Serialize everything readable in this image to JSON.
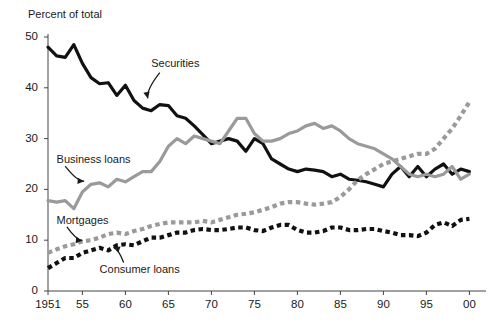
{
  "chart_data": {
    "type": "line",
    "title": "",
    "subtitle": "",
    "ylabel": "Percent of total",
    "xlabel": "",
    "ylim": [
      0,
      50
    ],
    "xlim": [
      1951,
      2001
    ],
    "grid": false,
    "legend_position": "inline-annotations",
    "ytick_labels": [
      "0",
      "10",
      "20",
      "30",
      "40",
      "50"
    ],
    "ytick_values": [
      0,
      10,
      20,
      30,
      40,
      50
    ],
    "xtick_labels": [
      "1951",
      "55",
      "60",
      "65",
      "70",
      "75",
      "80",
      "85",
      "90",
      "95",
      "00"
    ],
    "xtick_values": [
      1951,
      1955,
      1960,
      1965,
      1970,
      1975,
      1980,
      1985,
      1990,
      1995,
      2000
    ],
    "annotations": [
      {
        "text": "Securities",
        "x": 1963,
        "y": 44.5
      },
      {
        "text": "Business loans",
        "x": 1952,
        "y": 25.5
      },
      {
        "text": "Mortgages",
        "x": 1952,
        "y": 13.5
      },
      {
        "text": "Consumer loans",
        "x": 1957,
        "y": 4.0
      }
    ],
    "x": [
      1951,
      1952,
      1953,
      1954,
      1955,
      1956,
      1957,
      1958,
      1959,
      1960,
      1961,
      1962,
      1963,
      1964,
      1965,
      1966,
      1967,
      1968,
      1969,
      1970,
      1971,
      1972,
      1973,
      1974,
      1975,
      1976,
      1977,
      1978,
      1979,
      1980,
      1981,
      1982,
      1983,
      1984,
      1985,
      1986,
      1987,
      1988,
      1989,
      1990,
      1991,
      1992,
      1993,
      1994,
      1995,
      1996,
      1997,
      1998,
      1999,
      2000
    ],
    "series": [
      {
        "name": "Securities",
        "color": "#111111",
        "style": "solid",
        "values": [
          48.0,
          46.3,
          46.0,
          48.5,
          44.8,
          42.0,
          40.8,
          41.0,
          38.5,
          40.5,
          37.5,
          36.0,
          35.5,
          36.7,
          36.5,
          34.5,
          34.0,
          32.5,
          30.8,
          29.0,
          29.5,
          30.0,
          29.5,
          27.5,
          30.0,
          29.0,
          26.0,
          25.0,
          24.0,
          23.5,
          24.0,
          23.8,
          23.5,
          22.5,
          23.0,
          22.0,
          21.8,
          21.5,
          21.0,
          20.5,
          23.0,
          24.5,
          22.5,
          24.5,
          22.5,
          24.0,
          25.0,
          23.0,
          24.0,
          23.5
        ]
      },
      {
        "name": "Business loans",
        "color": "#9a9a9a",
        "style": "solid",
        "values": [
          17.8,
          17.5,
          17.8,
          16.2,
          19.5,
          21.0,
          21.3,
          20.5,
          22.0,
          21.5,
          22.5,
          23.5,
          23.5,
          25.5,
          28.5,
          30.0,
          29.0,
          30.5,
          30.0,
          29.5,
          29.0,
          31.5,
          34.0,
          34.0,
          31.0,
          29.5,
          29.5,
          30.0,
          31.0,
          31.5,
          32.5,
          33.0,
          32.0,
          32.5,
          31.5,
          30.0,
          29.0,
          28.5,
          28.0,
          27.0,
          26.0,
          24.5,
          23.0,
          22.5,
          23.0,
          22.5,
          23.0,
          24.5,
          22.0,
          23.0
        ]
      },
      {
        "name": "Mortgages",
        "color": "#9a9a9a",
        "style": "dotted",
        "values": [
          7.5,
          8.2,
          8.8,
          9.2,
          9.8,
          10.0,
          10.5,
          11.2,
          11.5,
          11.2,
          11.8,
          12.2,
          12.8,
          13.2,
          13.5,
          13.5,
          13.5,
          13.5,
          13.8,
          13.5,
          14.0,
          14.5,
          15.0,
          15.2,
          15.5,
          16.0,
          16.5,
          17.2,
          17.5,
          17.5,
          17.2,
          17.0,
          17.2,
          17.5,
          18.5,
          20.0,
          21.8,
          23.0,
          24.0,
          25.0,
          25.5,
          26.0,
          26.5,
          27.0,
          27.0,
          28.0,
          30.0,
          32.0,
          34.5,
          37.2
        ]
      },
      {
        "name": "Consumer loans",
        "color": "#111111",
        "style": "dotted",
        "values": [
          4.5,
          5.5,
          6.5,
          6.5,
          7.5,
          8.0,
          8.5,
          8.0,
          9.0,
          9.2,
          9.0,
          9.8,
          10.5,
          10.5,
          11.0,
          11.5,
          11.5,
          12.0,
          12.2,
          12.0,
          12.0,
          12.2,
          12.5,
          12.5,
          12.0,
          11.8,
          12.5,
          13.0,
          13.0,
          12.0,
          11.5,
          11.5,
          11.8,
          12.5,
          12.5,
          12.0,
          12.0,
          12.2,
          12.2,
          11.8,
          11.5,
          11.0,
          11.0,
          10.8,
          11.5,
          13.0,
          13.5,
          12.8,
          14.0,
          14.2
        ]
      }
    ]
  },
  "axis": {
    "y_title": "Percent of total"
  }
}
